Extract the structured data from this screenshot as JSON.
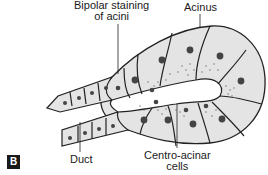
{
  "figure": {
    "panel_label": "B",
    "labels": {
      "bipolar_line1": "Bipolar staining",
      "bipolar_line2": "of acini",
      "acinus": "Acinus",
      "duct": "Duct",
      "centro_line1": "Centro-acinar",
      "centro_line2": "cells"
    },
    "colors": {
      "cell_fill": "#e4e4e4",
      "outline": "#222222",
      "nucleus": "#444444",
      "granule": "#666666",
      "lumen": "#ffffff"
    }
  }
}
